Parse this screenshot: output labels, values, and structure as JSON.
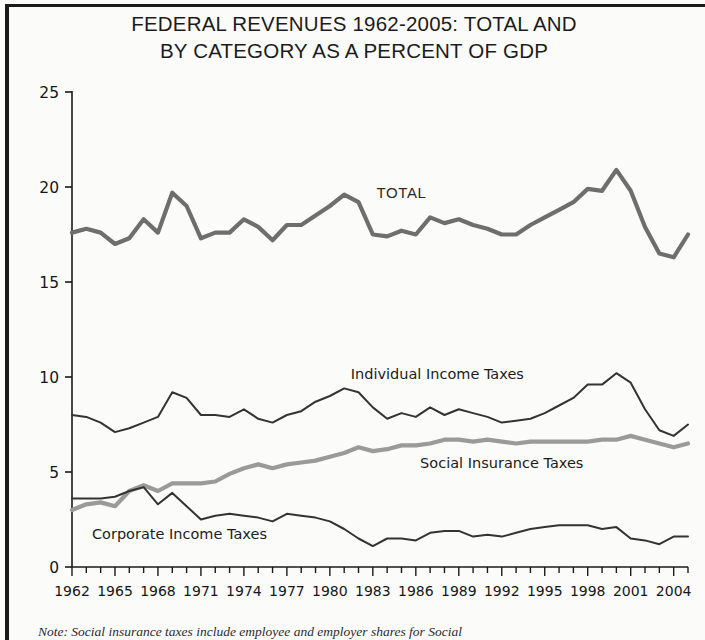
{
  "figure": {
    "title_line1": "FEDERAL REVENUES 1962-2005: TOTAL AND",
    "title_line2": "BY CATEGORY AS A PERCENT OF GDP",
    "note": "Note: Social insurance taxes include employee and employer shares for Social"
  },
  "labels": {
    "total": "TOTAL",
    "individual": "Individual Income Taxes",
    "social": "Social Insurance Taxes",
    "corporate": "Corporate Income Taxes"
  },
  "colors": {
    "total_line": "#6e6e6e",
    "individual_line": "#333333",
    "social_line": "#9a9a9a",
    "corporate_line": "#333333",
    "axis": "#1a1a1a",
    "background": "#fbfbfa"
  },
  "chart_data": {
    "type": "line",
    "title": "FEDERAL REVENUES 1962-2005: TOTAL AND BY CATEGORY AS A PERCENT OF GDP",
    "xlabel": "",
    "ylabel": "",
    "ylim": [
      0,
      25
    ],
    "yticks": [
      0,
      5,
      10,
      15,
      20,
      25
    ],
    "xlim": [
      1962,
      2005
    ],
    "xticks": [
      1962,
      1965,
      1968,
      1971,
      1974,
      1977,
      1980,
      1983,
      1986,
      1989,
      1992,
      1995,
      1998,
      2001,
      2004
    ],
    "grid": false,
    "legend_position": "inline-annotations",
    "x": [
      1962,
      1963,
      1964,
      1965,
      1966,
      1967,
      1968,
      1969,
      1970,
      1971,
      1972,
      1973,
      1974,
      1975,
      1976,
      1977,
      1978,
      1979,
      1980,
      1981,
      1982,
      1983,
      1984,
      1985,
      1986,
      1987,
      1988,
      1989,
      1990,
      1991,
      1992,
      1993,
      1994,
      1995,
      1996,
      1997,
      1998,
      1999,
      2000,
      2001,
      2002,
      2003,
      2004,
      2005
    ],
    "series": [
      {
        "name": "TOTAL",
        "values": [
          17.6,
          17.8,
          17.6,
          17.0,
          17.3,
          18.3,
          17.6,
          19.7,
          19.0,
          17.3,
          17.6,
          17.6,
          18.3,
          17.9,
          17.2,
          18.0,
          18.0,
          18.5,
          19.0,
          19.6,
          19.2,
          17.5,
          17.4,
          17.7,
          17.5,
          18.4,
          18.1,
          18.3,
          18.0,
          17.8,
          17.5,
          17.5,
          18.0,
          18.4,
          18.8,
          19.2,
          19.9,
          19.8,
          20.9,
          19.8,
          17.9,
          16.5,
          16.3,
          17.5
        ]
      },
      {
        "name": "Individual Income Taxes",
        "values": [
          8.0,
          7.9,
          7.6,
          7.1,
          7.3,
          7.6,
          7.9,
          9.2,
          8.9,
          8.0,
          8.0,
          7.9,
          8.3,
          7.8,
          7.6,
          8.0,
          8.2,
          8.7,
          9.0,
          9.4,
          9.2,
          8.4,
          7.8,
          8.1,
          7.9,
          8.4,
          8.0,
          8.3,
          8.1,
          7.9,
          7.6,
          7.7,
          7.8,
          8.1,
          8.5,
          8.9,
          9.6,
          9.6,
          10.2,
          9.7,
          8.3,
          7.2,
          6.9,
          7.5
        ]
      },
      {
        "name": "Social Insurance Taxes",
        "values": [
          3.0,
          3.3,
          3.4,
          3.2,
          4.0,
          4.3,
          4.0,
          4.4,
          4.4,
          4.4,
          4.5,
          4.9,
          5.2,
          5.4,
          5.2,
          5.4,
          5.5,
          5.6,
          5.8,
          6.0,
          6.3,
          6.1,
          6.2,
          6.4,
          6.4,
          6.5,
          6.7,
          6.7,
          6.6,
          6.7,
          6.6,
          6.5,
          6.6,
          6.6,
          6.6,
          6.6,
          6.6,
          6.7,
          6.7,
          6.9,
          6.7,
          6.5,
          6.3,
          6.5
        ]
      },
      {
        "name": "Corporate Income Taxes",
        "values": [
          3.6,
          3.6,
          3.6,
          3.7,
          4.0,
          4.2,
          3.3,
          3.9,
          3.2,
          2.5,
          2.7,
          2.8,
          2.7,
          2.6,
          2.4,
          2.8,
          2.7,
          2.6,
          2.4,
          2.0,
          1.5,
          1.1,
          1.5,
          1.5,
          1.4,
          1.8,
          1.9,
          1.9,
          1.6,
          1.7,
          1.6,
          1.8,
          2.0,
          2.1,
          2.2,
          2.2,
          2.2,
          2.0,
          2.1,
          1.5,
          1.4,
          1.2,
          1.6,
          1.6
        ]
      }
    ],
    "annotations": [
      {
        "text": "TOTAL",
        "x": 1985,
        "y": 19.4
      },
      {
        "text": "Individual Income Taxes",
        "x": 1987.5,
        "y": 9.9
      },
      {
        "text": "Social Insurance Taxes",
        "x": 1992,
        "y": 5.2
      },
      {
        "text": "Corporate Income Taxes",
        "x": 1969.5,
        "y": 1.5
      }
    ]
  }
}
